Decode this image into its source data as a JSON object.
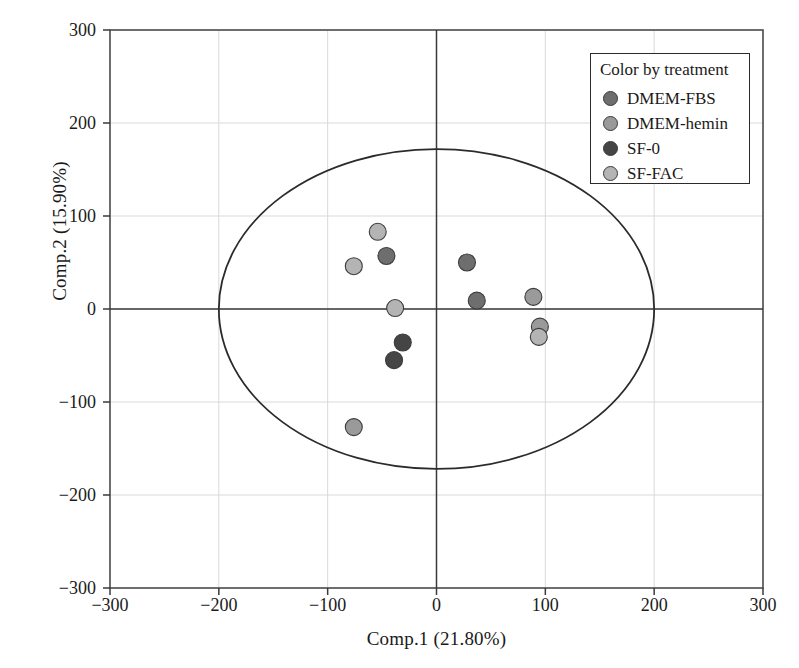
{
  "chart_data": {
    "type": "scatter",
    "title": "",
    "xlabel": "Comp.1 (21.80%)",
    "ylabel": "Comp.2 (15.90%)",
    "xlim": [
      -300,
      300
    ],
    "ylim": [
      -300,
      300
    ],
    "xticks": [
      "-300",
      "-200",
      "-100",
      "0",
      "100",
      "200",
      "300"
    ],
    "yticks": [
      "300",
      "200",
      "100",
      "0",
      "-100",
      "-200",
      "-300"
    ],
    "xtick_values": [
      -300,
      -200,
      -100,
      0,
      100,
      200,
      300
    ],
    "ytick_values": [
      300,
      200,
      100,
      0,
      -100,
      -200,
      -300
    ],
    "grid": true,
    "legend_position": "top-right",
    "legend_title": "Color by treatment",
    "zero_lines": true,
    "confidence_ellipse": {
      "center_x": 0,
      "center_y": 0,
      "semi_axis_x": 200,
      "semi_axis_y": 172,
      "stroke": "#2b2b2b"
    },
    "series": [
      {
        "name": "DMEM-FBS",
        "color": "#6e6e6e",
        "points": [
          {
            "x": -46,
            "y": 57
          },
          {
            "x": 28,
            "y": 50
          },
          {
            "x": 37,
            "y": 9
          }
        ]
      },
      {
        "name": "DMEM-hemin",
        "color": "#9a9a9a",
        "points": [
          {
            "x": 89,
            "y": 13
          },
          {
            "x": 95,
            "y": -19
          },
          {
            "x": -76,
            "y": -127
          }
        ]
      },
      {
        "name": "SF-0",
        "color": "#454545",
        "points": [
          {
            "x": -31,
            "y": -36
          },
          {
            "x": -39,
            "y": -55
          }
        ]
      },
      {
        "name": "SF-FAC",
        "color": "#b4b4b4",
        "points": [
          {
            "x": -54,
            "y": 83
          },
          {
            "x": -76,
            "y": 46
          },
          {
            "x": -38,
            "y": 1
          },
          {
            "x": 94,
            "y": -30
          }
        ]
      }
    ]
  },
  "legend": {
    "title": "Color by treatment",
    "items": [
      {
        "label": "DMEM-FBS",
        "color": "#6e6e6e"
      },
      {
        "label": "DMEM-hemin",
        "color": "#9a9a9a"
      },
      {
        "label": "SF-0",
        "color": "#454545"
      },
      {
        "label": "SF-FAC",
        "color": "#b4b4b4"
      }
    ]
  }
}
